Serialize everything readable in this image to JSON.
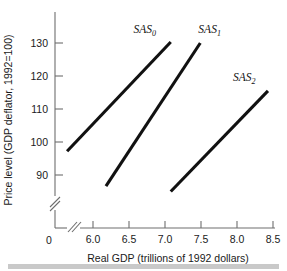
{
  "chart_data": {
    "type": "line",
    "title": "",
    "xlabel": "Real GDP (trillions of 1992 dollars)",
    "ylabel": "Price level (GDP deflator, 1992=100)",
    "xlim": [
      5.5,
      8.7
    ],
    "ylim": [
      83,
      134
    ],
    "grid": false,
    "legend_position": "inline-labels",
    "axis_break_x": true,
    "axis_break_y": true,
    "x_origin_label": "0",
    "y_origin_label": "0",
    "xticks": [
      "6.0",
      "6.5",
      "7.0",
      "7.5",
      "8.0",
      "8.5"
    ],
    "xtick_values": [
      6.0,
      6.5,
      7.0,
      7.5,
      8.0,
      8.5
    ],
    "yticks": [
      "90",
      "100",
      "110",
      "120",
      "130"
    ],
    "ytick_values": [
      90,
      100,
      110,
      120,
      130
    ],
    "series": [
      {
        "name": "SAS0",
        "label_text": "SAS",
        "label_sub": "0",
        "x": [
          5.64,
          7.08
        ],
        "y": [
          97.2,
          130.3
        ],
        "label_x": 6.72,
        "label_y": 133.0
      },
      {
        "name": "SAS1",
        "label_text": "SAS",
        "label_sub": "1",
        "x": [
          6.18,
          7.49
        ],
        "y": [
          86.6,
          130.0
        ],
        "label_x": 7.62,
        "label_y": 133.0
      },
      {
        "name": "SAS2",
        "label_text": "SAS",
        "label_sub": "2",
        "x": [
          7.08,
          8.43
        ],
        "y": [
          85.0,
          115.5
        ],
        "label_x": 8.1,
        "label_y": 118.6
      }
    ]
  },
  "colors": {
    "curve": "#111111",
    "axis": "#6e6e6e",
    "text": "#1a1a1a",
    "footer_bar": "#c9c9c9",
    "background": "#ffffff"
  }
}
